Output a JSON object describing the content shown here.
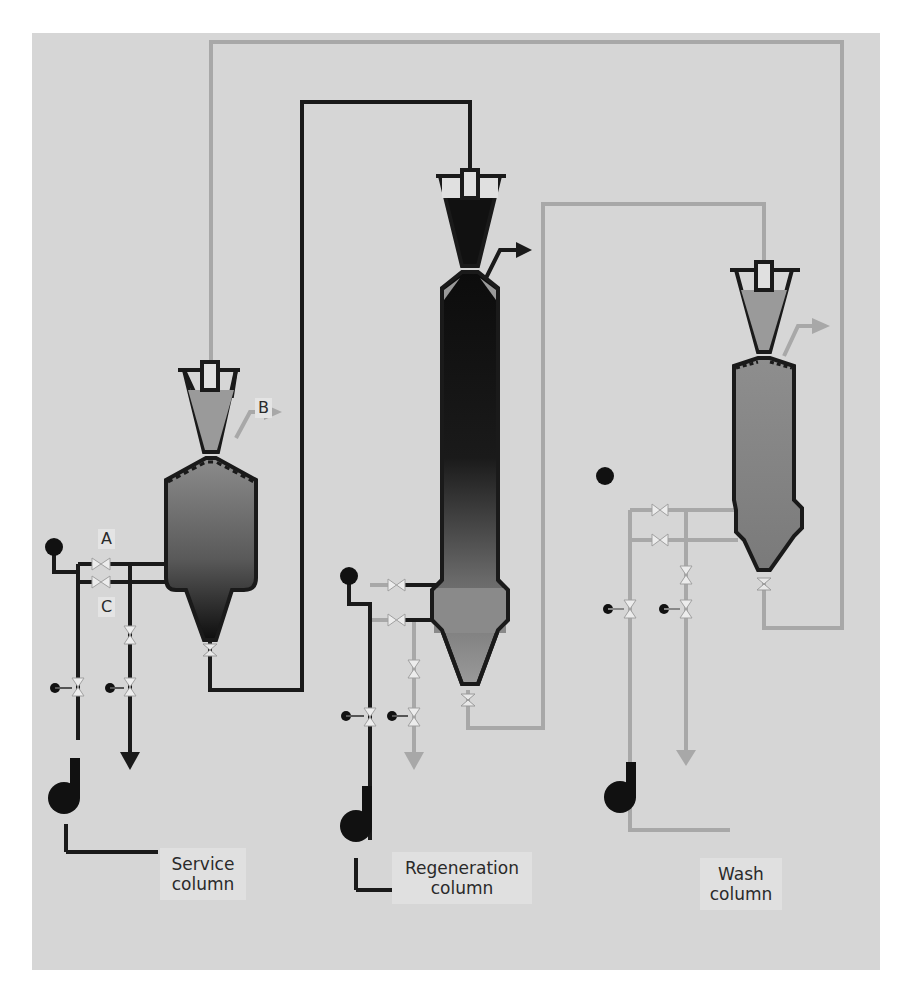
{
  "diagram": {
    "type": "process-flow",
    "columns": [
      {
        "id": "service",
        "label_line1": "Service",
        "label_line2": "column"
      },
      {
        "id": "regeneration",
        "label_line1": "Regeneration",
        "label_line2": "column"
      },
      {
        "id": "wash",
        "label_line1": "Wash",
        "label_line2": "column"
      }
    ],
    "stream_labels": {
      "a": "A",
      "b": "B",
      "c": "C"
    },
    "colors": {
      "background": "#d6d6d6",
      "dark_line": "#1a1a1a",
      "light_line": "#a8a8a8",
      "resin_dark": "#111111",
      "resin_mid": "#8a8a8a",
      "label_box": "#e0e0e0"
    }
  }
}
